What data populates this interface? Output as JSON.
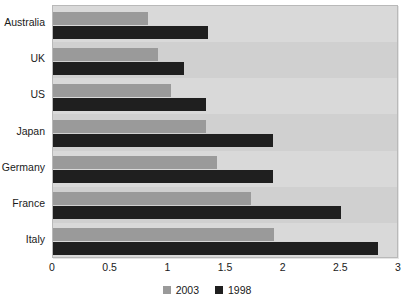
{
  "chart_data": {
    "type": "bar",
    "orientation": "horizontal",
    "title": "",
    "xlabel": "",
    "ylabel": "",
    "categories": [
      "Australia",
      "UK",
      "US",
      "Japan",
      "Germany",
      "France",
      "Italy"
    ],
    "series": [
      {
        "name": "2003",
        "color": "#9a9a9a",
        "values": [
          0.82,
          0.91,
          1.02,
          1.33,
          1.42,
          1.72,
          1.92
        ]
      },
      {
        "name": "1998",
        "color": "#1f1f1f",
        "values": [
          1.34,
          1.14,
          1.33,
          1.91,
          1.91,
          2.5,
          2.82
        ]
      }
    ],
    "xlim": [
      0,
      3
    ],
    "xticks": [
      0,
      0.5,
      1,
      1.5,
      2,
      2.5,
      3
    ],
    "xtick_labels": [
      "0",
      "0.5",
      "1",
      "1.5",
      "2",
      "2.5",
      "3"
    ],
    "grid": false,
    "legend_position": "bottom",
    "plot_background": "#d4d4d4"
  },
  "legend": {
    "entries": [
      {
        "label": "2003",
        "color": "#9a9a9a"
      },
      {
        "label": "1998",
        "color": "#1f1f1f"
      }
    ]
  }
}
